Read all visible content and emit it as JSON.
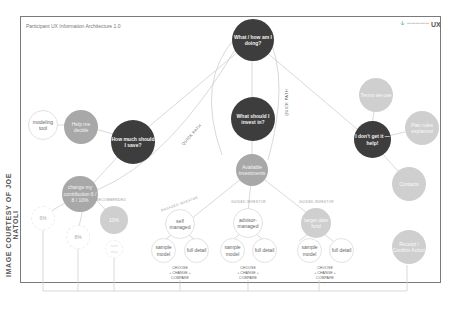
{
  "header": {
    "title": "Participant UX Information Architecture 1.0",
    "brand_logo": "logo-mark",
    "brand_text": "UX"
  },
  "credit": "IMAGE COURTESY OF JOE NATOLI",
  "diagram": {
    "nodes": {
      "root": "What / how am I doing?",
      "save": "How much should I save?",
      "invest": "What should I invest in?",
      "help": "I don't get it — help!",
      "help_decide": "Help me decide",
      "modeling_tool": "modeling tool",
      "change_contribution": "change my contribution 6 / 8 / 10%",
      "pct_6": "6%",
      "pct_8": "8%",
      "pct_10": "10%",
      "pct_10_sub": "next step",
      "available": "Available investments",
      "self_managed": "self managed",
      "advisor_managed": "advisor-managed",
      "target_date": "target date fund",
      "sample_model": "sample model",
      "full_detail": "full detail",
      "terms": "Terms we use",
      "plan_rules": "Plan rules explained",
      "contacts": "Contacts",
      "receipt": "Receipt / Confirm Action"
    },
    "arc_labels": {
      "engaged": "ENGAGED INVESTOR",
      "guided": "GUIDED INVESTOR",
      "guided2": "GUIDED INVESTOR",
      "recommended": "RECOMMENDED"
    },
    "path_labels": {
      "quick_path_1": "QUICK PATH",
      "quick_path_2": "QUICK PATH"
    },
    "choose_text": {
      "line1": "CHOOSE",
      "line2": "+ CHANGE +",
      "line3": "COMPARE",
      "arrow": "↑"
    }
  }
}
